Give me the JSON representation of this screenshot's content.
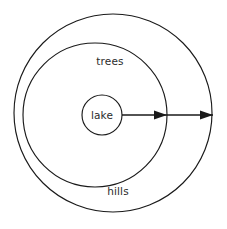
{
  "diagram": {
    "type": "concentric-ring-diagram",
    "background_color": "#ffffff",
    "stroke_color": "#1a1a1a",
    "text_color": "#2b2b2b",
    "zones": [
      {
        "id": "hills",
        "label": "hills",
        "order": 3,
        "shape": "circle",
        "center_x": 113,
        "center_y": 113,
        "radius": 99,
        "label_x": 118,
        "label_y": 192
      },
      {
        "id": "trees",
        "label": "trees",
        "order": 2,
        "shape": "circle",
        "center_x": 95,
        "center_y": 115,
        "radius": 72,
        "label_x": 110,
        "label_y": 62
      },
      {
        "id": "lake",
        "label": "lake",
        "order": 1,
        "shape": "circle",
        "center_x": 102,
        "center_y": 115,
        "radius": 20,
        "label_x": 102,
        "label_y": 116
      }
    ],
    "radius_arrow": {
      "id": "radius-arrow",
      "orientation": "horizontal",
      "y": 115,
      "x_start": 122,
      "x_end": 213,
      "arrowheads": [
        {
          "id": "arrowhead-trees-boundary",
          "x": 167,
          "y": 115
        },
        {
          "id": "arrowhead-hills-boundary",
          "x": 213,
          "y": 115
        }
      ]
    }
  }
}
